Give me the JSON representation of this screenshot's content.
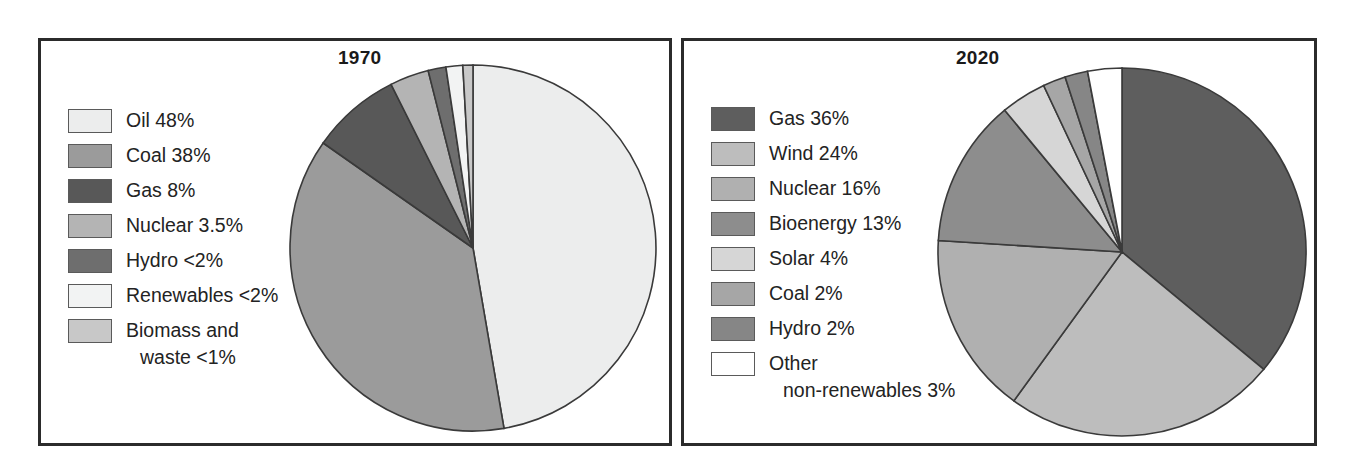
{
  "figure": {
    "background": "#ffffff",
    "frame_color": "#2b2b2b"
  },
  "panels": [
    {
      "id": "1970",
      "title": "1970",
      "legend": [
        {
          "label": "Oil 48%",
          "color": "#eceded"
        },
        {
          "label": "Coal 38%",
          "color": "#9b9b9b"
        },
        {
          "label": "Gas 8%",
          "color": "#585858"
        },
        {
          "label": "Nuclear 3.5%",
          "color": "#b4b4b4"
        },
        {
          "label": "Hydro <2%",
          "color": "#6e6e6e"
        },
        {
          "label": "Renewables <2%",
          "color": "#f2f3f3"
        },
        {
          "label": "Biomass and",
          "label_cont": "waste <1%",
          "color": "#c8c8c8"
        }
      ]
    },
    {
      "id": "2020",
      "title": "2020",
      "legend": [
        {
          "label": "Gas 36%",
          "color": "#5e5e5e"
        },
        {
          "label": "Wind 24%",
          "color": "#bdbdbd"
        },
        {
          "label": "Nuclear 16%",
          "color": "#b0b0b0"
        },
        {
          "label": "Bioenergy 13%",
          "color": "#8d8d8d"
        },
        {
          "label": "Solar 4%",
          "color": "#d6d6d6"
        },
        {
          "label": "Coal 2%",
          "color": "#a6a6a6"
        },
        {
          "label": "Hydro 2%",
          "color": "#868686"
        },
        {
          "label": "Other",
          "label_cont": "non-renewables 3%",
          "color": "#ffffff"
        }
      ]
    }
  ],
  "chart_data": [
    {
      "type": "pie",
      "title": "1970",
      "labels": [
        "Oil",
        "Coal",
        "Gas",
        "Nuclear",
        "Hydro",
        "Renewables",
        "Biomass and waste"
      ],
      "legend_labels": [
        "Oil 48%",
        "Coal 38%",
        "Gas 8%",
        "Nuclear 3.5%",
        "Hydro <2%",
        "Renewables <2%",
        "Biomass and waste <1%"
      ],
      "values": [
        48,
        38,
        8,
        3.5,
        1.6,
        1.5,
        0.9
      ],
      "value_text": [
        "48%",
        "38%",
        "8%",
        "3.5%",
        "<2%",
        "<2%",
        "<1%"
      ],
      "colors": [
        "#eceded",
        "#9b9b9b",
        "#585858",
        "#b4b4b4",
        "#6e6e6e",
        "#f2f3f3",
        "#c8c8c8"
      ],
      "start_angle_deg": 0,
      "direction": "clockwise",
      "legend_position": "left",
      "xlabel": "",
      "ylabel": ""
    },
    {
      "type": "pie",
      "title": "2020",
      "labels": [
        "Gas",
        "Wind",
        "Nuclear",
        "Bioenergy",
        "Solar",
        "Coal",
        "Hydro",
        "Other non-renewables"
      ],
      "legend_labels": [
        "Gas 36%",
        "Wind 24%",
        "Nuclear 16%",
        "Bioenergy 13%",
        "Solar 4%",
        "Coal 2%",
        "Hydro 2%",
        "Other non-renewables 3%"
      ],
      "values": [
        36,
        24,
        16,
        13,
        4,
        2,
        2,
        3
      ],
      "value_text": [
        "36%",
        "24%",
        "16%",
        "13%",
        "4%",
        "2%",
        "2%",
        "3%"
      ],
      "colors": [
        "#5e5e5e",
        "#bdbdbd",
        "#b0b0b0",
        "#8d8d8d",
        "#d6d6d6",
        "#a6a6a6",
        "#868686",
        "#ffffff"
      ],
      "start_angle_deg": 0,
      "direction": "clockwise",
      "legend_position": "left",
      "xlabel": "",
      "ylabel": ""
    }
  ]
}
